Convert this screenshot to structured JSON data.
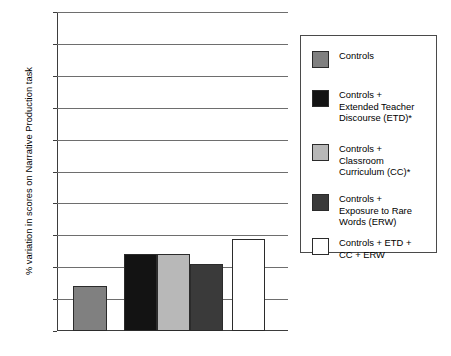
{
  "chart_data": {
    "type": "bar",
    "title": "",
    "xlabel": "",
    "ylabel": "% variation in scores on Narrative Production task",
    "ylim": [
      0,
      100
    ],
    "ytick_labels": [
      "100",
      "90",
      "80",
      "70",
      "60",
      "50",
      "40",
      "30",
      "20",
      "10",
      "0"
    ],
    "ytick_values": [
      100,
      90,
      80,
      70,
      60,
      50,
      40,
      30,
      20,
      10,
      0
    ],
    "grid": "horizontal",
    "legend_position": "right",
    "categories": [
      "Controls",
      "Controls + Extended Teacher Discourse (ETD)*",
      "Controls + Classroom Curriculum (CC)*",
      "Controls + Exposure to Rare Words (ERW)",
      "Controls + ETD + CC + ERW"
    ],
    "values": [
      14,
      24,
      24,
      21,
      29
    ],
    "bar_colors": [
      "#808080",
      "#131313",
      "#b8b8b8",
      "#3a3a3a",
      "#ffffff"
    ]
  },
  "legend": {
    "entries": [
      {
        "label": "Controls",
        "color": "#808080"
      },
      {
        "label": "Controls +\nExtended Teacher\nDiscourse (ETD)*",
        "color": "#131313"
      },
      {
        "label": "Controls +\nClassroom\nCurriculum (CC)*",
        "color": "#b8b8b8"
      },
      {
        "label": "Controls +\nExposure to Rare\nWords (ERW)",
        "color": "#3a3a3a"
      },
      {
        "label": "Controls + ETD +\nCC + ERW",
        "color": "#ffffff"
      }
    ]
  }
}
